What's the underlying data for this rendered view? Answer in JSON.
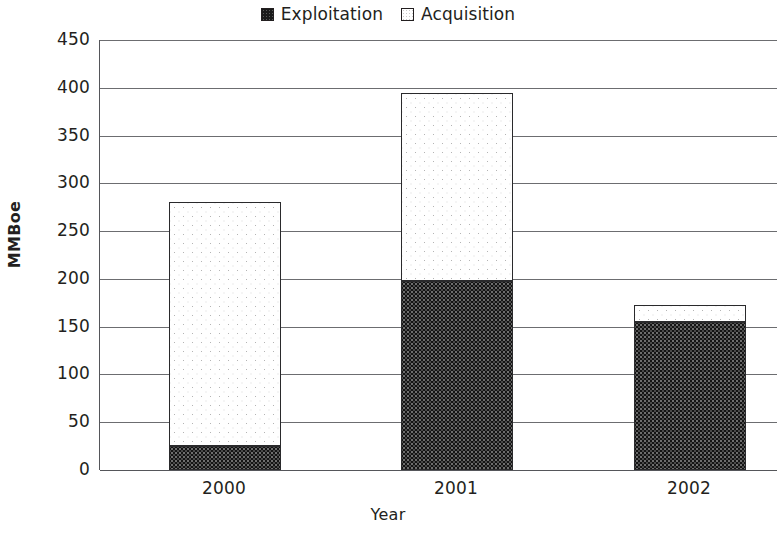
{
  "chart_data": {
    "type": "bar",
    "subtype": "stacked-vertical-bar",
    "title": "",
    "xlabel": "Year",
    "ylabel": "MMBoe",
    "categories": [
      "2000",
      "2001",
      "2002"
    ],
    "series": [
      {
        "name": "Exploitation",
        "values": [
          25,
          198,
          155
        ]
      },
      {
        "name": "Acquisition",
        "values": [
          255,
          197,
          18
        ]
      }
    ],
    "totals": [
      280,
      395,
      173
    ],
    "ylim": [
      0,
      450
    ],
    "yticks": [
      "0",
      "50",
      "100",
      "150",
      "200",
      "250",
      "300",
      "350",
      "400",
      "450"
    ],
    "ytick_values": [
      0,
      50,
      100,
      150,
      200,
      250,
      300,
      350,
      400,
      450
    ],
    "grid": "horizontal",
    "legend_position": "top-center",
    "colors": {
      "exploitation_fill": "#141414",
      "acquisition_fill": "#ffffff",
      "bar_outline": "#2a2a2c",
      "axis": "#55565a",
      "gridline": "#6c6d70",
      "text": "#231f20"
    }
  },
  "legend": {
    "entries": [
      {
        "label": "Exploitation",
        "swatch": "dark-dotted-square"
      },
      {
        "label": "Acquisition",
        "swatch": "white-dotted-square"
      }
    ]
  },
  "axes": {
    "y_title": "MMBoe",
    "x_title": "Year"
  }
}
